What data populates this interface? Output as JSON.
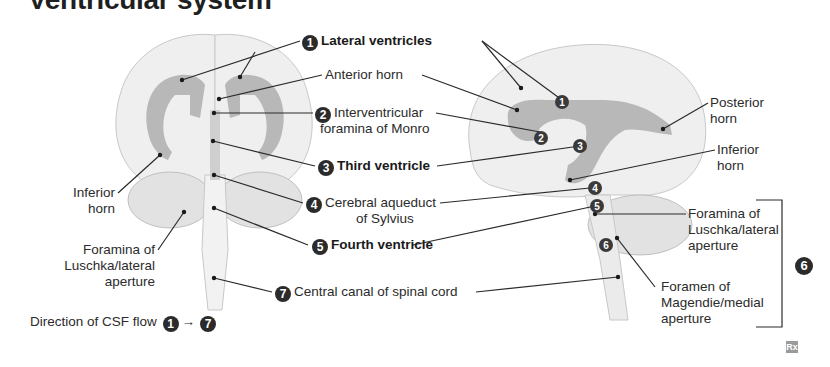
{
  "title": "Ventricular system",
  "labels": {
    "lateral_ventricles": {
      "num": "1",
      "text": "Lateral ventricles"
    },
    "anterior_horn": "Anterior horn",
    "interventricular": {
      "num": "2",
      "line1": "Interventricular",
      "line2": "foramina of Monro"
    },
    "third_ventricle": {
      "num": "3",
      "text": "Third ventricle"
    },
    "cerebral_aqueduct": {
      "num": "4",
      "line1": "Cerebral aqueduct",
      "line2": "of Sylvius"
    },
    "fourth_ventricle": {
      "num": "5",
      "text": "Fourth ventricle"
    },
    "central_canal": {
      "num": "7",
      "text": "Central canal of spinal cord"
    },
    "inferior_horn_left": {
      "line1": "Inferior",
      "line2": "horn"
    },
    "foramina_luschka_left": {
      "line1": "Foramina of",
      "line2": "Luschka/lateral",
      "line3": "aperture"
    },
    "posterior_horn": {
      "line1": "Posterior",
      "line2": "horn"
    },
    "inferior_horn_right": {
      "line1": "Inferior",
      "line2": "horn"
    },
    "foramina_luschka_right": {
      "line1": "Foramina of",
      "line2": "Luschka/lateral",
      "line3": "aperture"
    },
    "foramen_magendie": {
      "line1": "Foramen of",
      "line2": "Magendie/medial",
      "line3": "aperture"
    },
    "bracket_num": "6"
  },
  "sagittal_markers": [
    "1",
    "2",
    "3",
    "4",
    "5",
    "6"
  ],
  "flow": {
    "text": "Direction of CSF flow",
    "from": "1",
    "arrow": "→",
    "to": "7"
  },
  "logo": "Rx",
  "colors": {
    "ventricle": "#b8b8b8",
    "brain": "#efefef",
    "brain_outline": "#c8c8c8",
    "line": "#2b2b2b",
    "badge": "#2b2b2b"
  }
}
